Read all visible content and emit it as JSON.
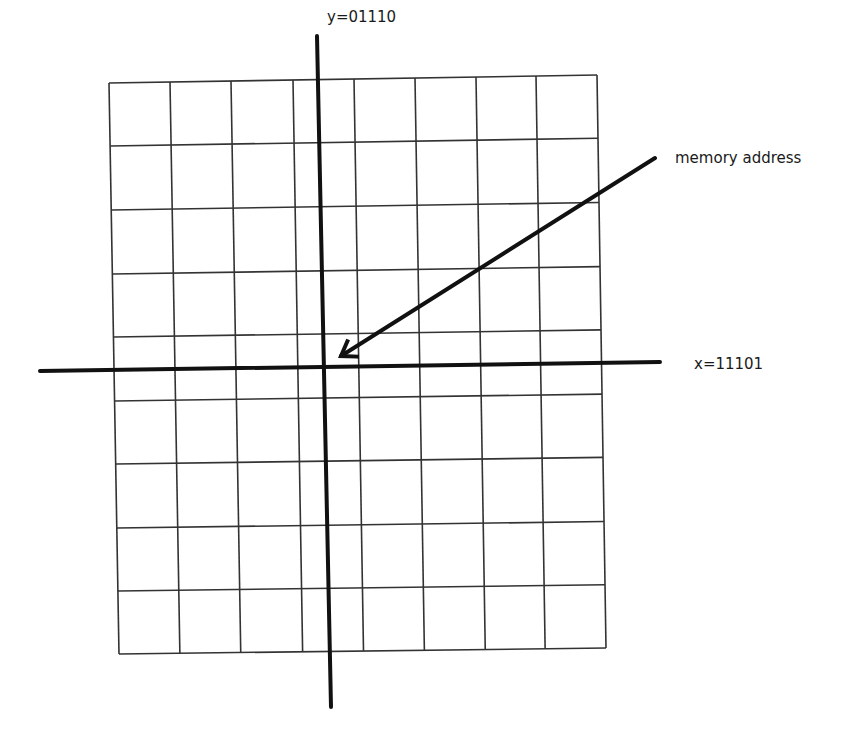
{
  "diagram": {
    "type": "coordinate-grid",
    "grid": {
      "columns": 8,
      "rows": 9,
      "corners": {
        "top_left": [
          109,
          83
        ],
        "top_right": [
          597,
          75
        ],
        "bottom_right": [
          606,
          648
        ],
        "bottom_left": [
          119,
          654
        ]
      },
      "vertical_lines_top_x": [
        109,
        170,
        231,
        293,
        354,
        415,
        476,
        536,
        597
      ],
      "horizontal_lines_left_y": [
        83,
        146,
        210,
        274,
        337,
        401,
        464,
        528,
        591,
        654
      ],
      "line_color": "#333333"
    },
    "axes": {
      "x_axis": {
        "from": [
          40,
          371
        ],
        "to": [
          660,
          362
        ],
        "label": "x=11101",
        "color": "#111111"
      },
      "y_axis": {
        "from": [
          317,
          36
        ],
        "to": [
          331,
          707
        ],
        "label": "y=01110",
        "color": "#111111"
      }
    },
    "arrow": {
      "label": "memory address",
      "from": [
        655,
        158
      ],
      "to": [
        341,
        356
      ],
      "color": "#111111"
    }
  },
  "labels": {
    "y_axis": "y=01110",
    "x_axis": "x=11101",
    "arrow": "memory address"
  }
}
